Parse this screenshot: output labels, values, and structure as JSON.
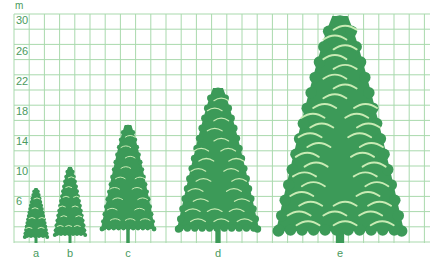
{
  "diagram": {
    "unit_label": "m",
    "colors": {
      "grid": "#a9d9ad",
      "tree": "#3c9a58",
      "highlight": "#c9ebb4",
      "label": "#4a9a5e"
    },
    "grid": {
      "left": 14,
      "top": 14,
      "right": 430,
      "bottom": 243,
      "cell": 15.2
    },
    "y_ticks": [
      {
        "label": "30",
        "y": 22
      },
      {
        "label": "26",
        "y": 53
      },
      {
        "label": "22",
        "y": 83
      },
      {
        "label": "18",
        "y": 113
      },
      {
        "label": "14",
        "y": 143
      },
      {
        "label": "10",
        "y": 173
      },
      {
        "label": "6",
        "y": 203
      }
    ],
    "trees": [
      {
        "label": "a",
        "cx": 36,
        "top": 188,
        "crown_bottom": 237,
        "half_width": 12,
        "height_m": 7
      },
      {
        "label": "b",
        "cx": 70,
        "top": 167,
        "crown_bottom": 235,
        "half_width": 16,
        "height_m": 10
      },
      {
        "label": "c",
        "cx": 128,
        "top": 125,
        "crown_bottom": 229,
        "half_width": 27,
        "height_m": 16
      },
      {
        "label": "d",
        "cx": 218,
        "top": 88,
        "crown_bottom": 229,
        "half_width": 41,
        "height_m": 21
      },
      {
        "label": "e",
        "cx": 340,
        "top": 16,
        "crown_bottom": 231,
        "half_width": 64,
        "height_m": 30
      }
    ]
  }
}
